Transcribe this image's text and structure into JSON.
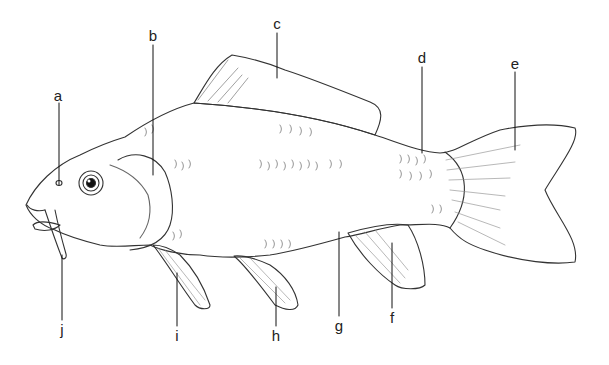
{
  "diagram": {
    "labels": [
      {
        "id": "a",
        "text": "a",
        "x": 58,
        "y": 90
      },
      {
        "id": "b",
        "text": "b",
        "x": 153,
        "y": 30
      },
      {
        "id": "c",
        "text": "c",
        "x": 277,
        "y": 15
      },
      {
        "id": "d",
        "text": "d",
        "x": 422,
        "y": 52
      },
      {
        "id": "e",
        "text": "e",
        "x": 515,
        "y": 57
      },
      {
        "id": "f",
        "text": "f",
        "x": 392,
        "y": 310
      },
      {
        "id": "g",
        "text": "g",
        "x": 339,
        "y": 318
      },
      {
        "id": "h",
        "text": "h",
        "x": 276,
        "y": 328
      },
      {
        "id": "i",
        "text": "i",
        "x": 177,
        "y": 328
      },
      {
        "id": "j",
        "text": "j",
        "x": 62,
        "y": 322
      }
    ]
  }
}
